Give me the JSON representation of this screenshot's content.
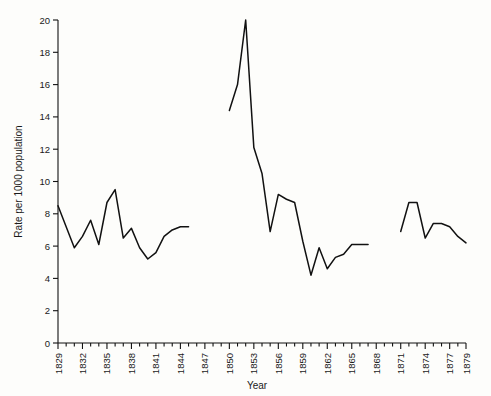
{
  "chart_data": {
    "type": "line",
    "title": "",
    "xlabel": "Year",
    "ylabel": "Rate per 1000 population",
    "xlim": [
      1829,
      1879
    ],
    "ylim": [
      0,
      20
    ],
    "ytick_step": 2,
    "xtick_step_minor": 1,
    "xtick_step_major": 3,
    "grid": false,
    "legend": false,
    "line_color": "#111111",
    "yticks": [
      0,
      2,
      4,
      6,
      8,
      10,
      12,
      14,
      16,
      18,
      20
    ],
    "xticks_labeled": [
      1829,
      1832,
      1835,
      1838,
      1841,
      1844,
      1847,
      1850,
      1853,
      1856,
      1859,
      1862,
      1865,
      1868,
      1871,
      1874,
      1877,
      1879
    ],
    "series": [
      {
        "name": "segment-1",
        "x": [
          1829,
          1830,
          1831,
          1832,
          1833,
          1834,
          1835,
          1836,
          1837,
          1838,
          1839,
          1840,
          1841,
          1842,
          1843,
          1844,
          1845
        ],
        "values": [
          8.5,
          7.2,
          5.9,
          6.6,
          7.6,
          6.1,
          8.7,
          9.5,
          6.5,
          7.1,
          5.9,
          5.2,
          5.6,
          6.6,
          7.0,
          7.2,
          7.2
        ]
      },
      {
        "name": "segment-2",
        "x": [
          1850,
          1851,
          1852,
          1853,
          1854,
          1855,
          1856,
          1857,
          1858,
          1859,
          1860,
          1861,
          1862,
          1863,
          1864,
          1865,
          1866,
          1867
        ],
        "values": [
          14.4,
          16.0,
          20.0,
          12.1,
          10.5,
          6.9,
          9.2,
          8.9,
          8.7,
          6.3,
          4.2,
          5.9,
          4.6,
          5.3,
          5.5,
          6.1,
          6.1,
          6.1
        ]
      },
      {
        "name": "segment-3",
        "x": [
          1871,
          1872,
          1873,
          1874,
          1875,
          1876,
          1877,
          1878,
          1879
        ],
        "values": [
          6.9,
          8.7,
          8.7,
          6.5,
          7.4,
          7.4,
          7.2,
          6.6,
          6.2
        ]
      }
    ]
  }
}
